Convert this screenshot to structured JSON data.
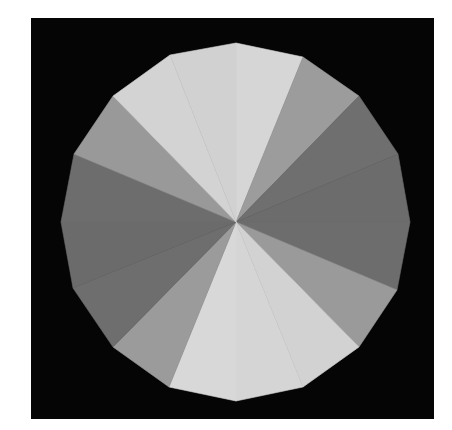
{
  "canvas": {
    "width": 452,
    "height": 430,
    "background": "#ffffff"
  },
  "frame": {
    "x": 31,
    "y": 18,
    "width": 403,
    "height": 401,
    "color": "#050505"
  },
  "polygon": {
    "center": [
      236,
      222
    ],
    "sides": 16,
    "vertices": [
      [
        236,
        43
      ],
      [
        303,
        57
      ],
      [
        359,
        96
      ],
      [
        398,
        154
      ],
      [
        410,
        222
      ],
      [
        397,
        290
      ],
      [
        359,
        347
      ],
      [
        303,
        387
      ],
      [
        236,
        401
      ],
      [
        169,
        387
      ],
      [
        113,
        347
      ],
      [
        73,
        288
      ],
      [
        61,
        222
      ],
      [
        74,
        154
      ],
      [
        113,
        96
      ],
      [
        170,
        55
      ]
    ],
    "wedge_colors": [
      "#d6d6d6",
      "#9c9c9c",
      "#6f6f6f",
      "#6c6c6c",
      "#6d6d6d",
      "#9a9a9a",
      "#d2d2d2",
      "#d5d5d5",
      "#d8d8d8",
      "#9b9b9b",
      "#6e6e6e",
      "#6b6b6b",
      "#6d6d6d",
      "#999999",
      "#d3d3d3",
      "#d1d1d1"
    ]
  },
  "palette": {
    "light": "#d4d4d4",
    "mid": "#9a9a9a",
    "dark": "#6e6e6e"
  }
}
